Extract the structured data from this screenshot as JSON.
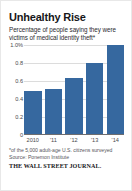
{
  "card": {
    "title": "Unhealthy Rise",
    "subtitle": "Percentage of people saying they were victims of medical identity theft*",
    "footnote": "*of the 5,000 adult-age U.S. citizens surveyed",
    "source": "Source: Ponemon Institute",
    "logo": "THE WALL STREET JOURNAL.",
    "bar_color": "#36689f",
    "grid_color": "#dcdcdc",
    "axis_color": "#6d6d70",
    "title_color": "#17171a"
  },
  "chart_data": {
    "type": "bar",
    "title": "Unhealthy Rise",
    "subtitle": "Percentage of people saying they were victims of medical identity theft*",
    "categories": [
      "2010",
      "'11",
      "'12",
      "'13",
      "'14"
    ],
    "values": [
      0.49,
      0.51,
      0.63,
      0.8,
      1.0
    ],
    "xlabel": "",
    "ylabel": "",
    "ylim": [
      0,
      1.0
    ],
    "yticks": [
      0,
      0.2,
      0.4,
      0.6,
      0.8,
      1.0
    ],
    "ytick_labels": [
      "0",
      "0.2",
      "0.4",
      "0.6",
      "0.8",
      "1.0%"
    ],
    "grid": true,
    "legend": false,
    "series_color": "#36689f"
  }
}
